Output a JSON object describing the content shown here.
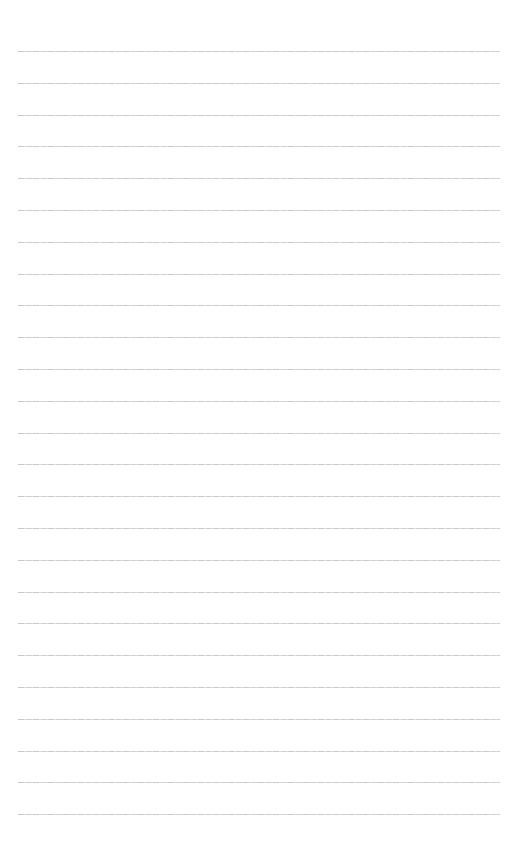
{
  "document": {
    "type": "lined-paper",
    "background_color": "#ffffff",
    "line_color": "#cccccc",
    "line_count": 25,
    "first_line_y": 51,
    "line_spacing": 31.8,
    "line_left": 18,
    "line_right": 500,
    "text_lines": []
  }
}
